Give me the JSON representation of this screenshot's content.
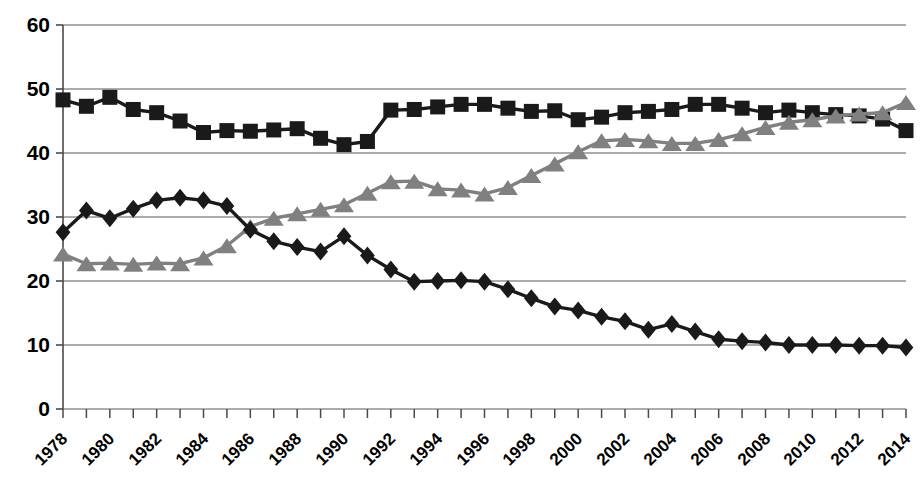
{
  "chart_data": {
    "type": "line",
    "title": "",
    "subtitle": "",
    "xlabel": "",
    "ylabel": "",
    "xlim": [
      1978,
      2014
    ],
    "ylim": [
      0,
      60
    ],
    "grid": true,
    "legend_position": "none",
    "y_ticks": [
      0,
      10,
      20,
      30,
      40,
      50,
      60
    ],
    "x_tick_labels": [
      "1978",
      "1980",
      "1982",
      "1984",
      "1986",
      "1988",
      "1990",
      "1992",
      "1994",
      "1996",
      "1998",
      "2000",
      "2002",
      "2004",
      "2006",
      "2008",
      "2010",
      "2012",
      "2014"
    ],
    "x": [
      1978,
      1979,
      1980,
      1981,
      1982,
      1983,
      1984,
      1985,
      1986,
      1987,
      1988,
      1989,
      1990,
      1991,
      1992,
      1993,
      1994,
      1995,
      1996,
      1997,
      1998,
      1999,
      2000,
      2001,
      2002,
      2003,
      2004,
      2005,
      2006,
      2007,
      2008,
      2009,
      2010,
      2011,
      2012,
      2013,
      2014
    ],
    "series": [
      {
        "name": "series-squares",
        "marker": "square",
        "color": "#1a1a1a",
        "values": [
          48.3,
          47.3,
          48.7,
          46.8,
          46.3,
          45.0,
          43.2,
          43.5,
          43.4,
          43.6,
          43.8,
          42.3,
          41.3,
          41.8,
          46.7,
          46.8,
          47.2,
          47.6,
          47.6,
          47.0,
          46.5,
          46.6,
          45.2,
          45.6,
          46.3,
          46.5,
          46.8,
          47.6,
          47.6,
          47.0,
          46.3,
          46.7,
          46.3,
          46.0,
          45.8,
          45.3,
          43.5
        ]
      },
      {
        "name": "series-triangles",
        "marker": "triangle",
        "color": "#808080",
        "values": [
          24.2,
          22.7,
          22.8,
          22.6,
          22.8,
          22.7,
          23.6,
          25.5,
          28.5,
          29.8,
          30.5,
          31.2,
          31.9,
          33.7,
          35.5,
          35.6,
          34.4,
          34.2,
          33.6,
          34.6,
          36.5,
          38.3,
          40.2,
          41.9,
          42.1,
          41.9,
          41.5,
          41.5,
          42.1,
          43.0,
          44.0,
          44.8,
          45.2,
          45.8,
          46.1,
          46.3,
          47.9
        ]
      },
      {
        "name": "series-diamonds",
        "marker": "diamond",
        "color": "#1a1a1a",
        "values": [
          27.6,
          31.0,
          29.8,
          31.3,
          32.6,
          33.0,
          32.6,
          31.7,
          28.0,
          26.2,
          25.3,
          24.6,
          27.0,
          24.0,
          21.8,
          19.9,
          20.0,
          20.1,
          19.9,
          18.7,
          17.3,
          16.0,
          15.4,
          14.4,
          13.7,
          12.4,
          13.3,
          12.1,
          10.9,
          10.6,
          10.4,
          10.0,
          10.0,
          10.0,
          9.9,
          9.9,
          9.6
        ]
      }
    ]
  }
}
